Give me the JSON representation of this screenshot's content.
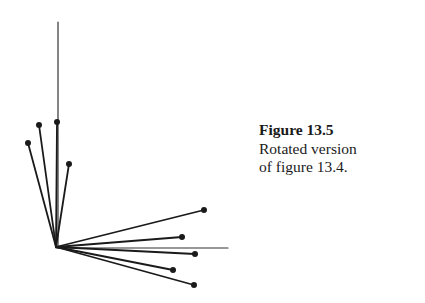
{
  "caption": {
    "title": "Figure 13.5",
    "line1": "Rotated version",
    "line2": "of figure 13.4."
  },
  "chart_data": {
    "type": "vector-plot",
    "title": "Figure 13.5",
    "subtitle": "Rotated version of figure 13.4.",
    "origin": [
      56,
      247
    ],
    "axes": {
      "vertical_end": [
        58,
        22
      ],
      "horizontal_end": [
        228,
        248
      ]
    },
    "vectors": [
      {
        "end": [
          28,
          143
        ]
      },
      {
        "end": [
          39,
          125
        ]
      },
      {
        "end": [
          57,
          122
        ]
      },
      {
        "end": [
          69,
          164
        ]
      },
      {
        "end": [
          204,
          210
        ]
      },
      {
        "end": [
          182,
          237
        ]
      },
      {
        "end": [
          195,
          254
        ]
      },
      {
        "end": [
          173,
          270
        ]
      },
      {
        "end": [
          194,
          285
        ]
      }
    ],
    "colors": {
      "line": "#1a1a1a",
      "axis": "#333333"
    }
  }
}
